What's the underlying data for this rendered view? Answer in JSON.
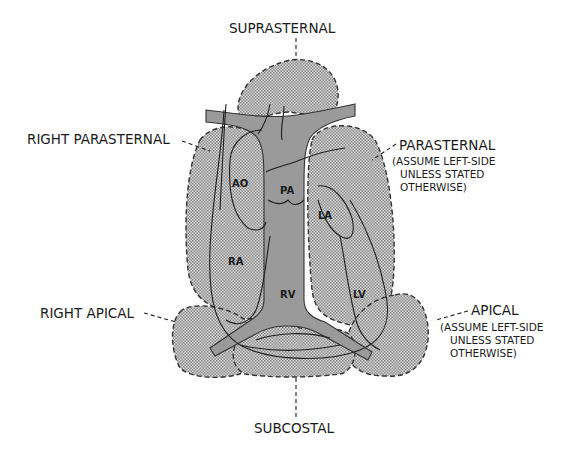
{
  "diagram": {
    "windows": [
      {
        "id": "suprasternal",
        "label": "SUPRASTERNAL",
        "note": []
      },
      {
        "id": "right-parasternal",
        "label": "RIGHT PARASTERNAL",
        "note": []
      },
      {
        "id": "parasternal",
        "label": "PARASTERNAL",
        "note": [
          "(ASSUME LEFT-SIDE",
          "UNLESS STATED",
          "OTHERWISE)"
        ]
      },
      {
        "id": "right-apical",
        "label": "RIGHT APICAL",
        "note": []
      },
      {
        "id": "apical",
        "label": "APICAL",
        "note": [
          "(ASSUME LEFT-SIDE",
          "UNLESS STATED",
          "OTHERWISE)"
        ]
      },
      {
        "id": "subcostal",
        "label": "SUBCOSTAL",
        "note": []
      }
    ],
    "chambers": [
      {
        "id": "ao",
        "label": "AO"
      },
      {
        "id": "pa",
        "label": "PA"
      },
      {
        "id": "la",
        "label": "LA"
      },
      {
        "id": "ra",
        "label": "RA"
      },
      {
        "id": "rv",
        "label": "RV"
      },
      {
        "id": "lv",
        "label": "LV"
      }
    ],
    "colors": {
      "window_fill": "#c8c8c8",
      "vessel_fill": "#9a9a9a",
      "line": "#1f1f1f",
      "background": "#ffffff"
    }
  }
}
